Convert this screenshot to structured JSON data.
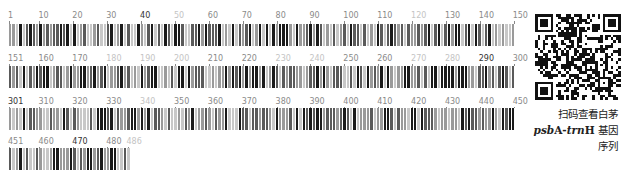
{
  "sequence_barcode": {
    "total_length": 486,
    "bases_per_row": 150,
    "rows": [
      {
        "start": 1,
        "end": 150,
        "ticks": [
          {
            "label": "1",
            "pos": 1,
            "tone": "mid"
          },
          {
            "label": "10",
            "pos": 10,
            "tone": "mid"
          },
          {
            "label": "20",
            "pos": 20,
            "tone": "mid"
          },
          {
            "label": "30",
            "pos": 30,
            "tone": "mid"
          },
          {
            "label": "40",
            "pos": 40,
            "tone": "dark"
          },
          {
            "label": "50",
            "pos": 50,
            "tone": "light"
          },
          {
            "label": "60",
            "pos": 60,
            "tone": "mid"
          },
          {
            "label": "70",
            "pos": 70,
            "tone": "mid"
          },
          {
            "label": "80",
            "pos": 80,
            "tone": "mid"
          },
          {
            "label": "90",
            "pos": 90,
            "tone": "mid"
          },
          {
            "label": "100",
            "pos": 100,
            "tone": "mid"
          },
          {
            "label": "110",
            "pos": 110,
            "tone": "mid"
          },
          {
            "label": "120",
            "pos": 120,
            "tone": "light"
          },
          {
            "label": "130",
            "pos": 130,
            "tone": "mid"
          },
          {
            "label": "140",
            "pos": 140,
            "tone": "mid"
          },
          {
            "label": "150",
            "pos": 150,
            "tone": "mid"
          }
        ]
      },
      {
        "start": 151,
        "end": 300,
        "ticks": [
          {
            "label": "151",
            "pos": 1,
            "tone": "mid"
          },
          {
            "label": "160",
            "pos": 10,
            "tone": "mid"
          },
          {
            "label": "170",
            "pos": 20,
            "tone": "mid"
          },
          {
            "label": "180",
            "pos": 30,
            "tone": "light"
          },
          {
            "label": "190",
            "pos": 40,
            "tone": "light"
          },
          {
            "label": "200",
            "pos": 50,
            "tone": "light"
          },
          {
            "label": "210",
            "pos": 60,
            "tone": "mid"
          },
          {
            "label": "220",
            "pos": 70,
            "tone": "mid"
          },
          {
            "label": "230",
            "pos": 80,
            "tone": "light"
          },
          {
            "label": "240",
            "pos": 90,
            "tone": "light"
          },
          {
            "label": "250",
            "pos": 100,
            "tone": "mid"
          },
          {
            "label": "260",
            "pos": 110,
            "tone": "mid"
          },
          {
            "label": "270",
            "pos": 120,
            "tone": "light"
          },
          {
            "label": "280",
            "pos": 130,
            "tone": "light"
          },
          {
            "label": "290",
            "pos": 140,
            "tone": "dark"
          },
          {
            "label": "300",
            "pos": 150,
            "tone": "mid"
          }
        ]
      },
      {
        "start": 301,
        "end": 450,
        "ticks": [
          {
            "label": "301",
            "pos": 1,
            "tone": "dark"
          },
          {
            "label": "310",
            "pos": 10,
            "tone": "mid"
          },
          {
            "label": "320",
            "pos": 20,
            "tone": "mid"
          },
          {
            "label": "330",
            "pos": 30,
            "tone": "mid"
          },
          {
            "label": "340",
            "pos": 40,
            "tone": "light"
          },
          {
            "label": "350",
            "pos": 50,
            "tone": "mid"
          },
          {
            "label": "360",
            "pos": 60,
            "tone": "mid"
          },
          {
            "label": "370",
            "pos": 70,
            "tone": "mid"
          },
          {
            "label": "380",
            "pos": 80,
            "tone": "mid"
          },
          {
            "label": "390",
            "pos": 90,
            "tone": "mid"
          },
          {
            "label": "400",
            "pos": 100,
            "tone": "mid"
          },
          {
            "label": "410",
            "pos": 110,
            "tone": "mid"
          },
          {
            "label": "420",
            "pos": 120,
            "tone": "mid"
          },
          {
            "label": "430",
            "pos": 130,
            "tone": "mid"
          },
          {
            "label": "440",
            "pos": 140,
            "tone": "mid"
          },
          {
            "label": "450",
            "pos": 150,
            "tone": "mid"
          }
        ]
      },
      {
        "start": 451,
        "end": 486,
        "ticks": [
          {
            "label": "451",
            "pos": 1,
            "tone": "mid"
          },
          {
            "label": "460",
            "pos": 10,
            "tone": "mid"
          },
          {
            "label": "470",
            "pos": 20,
            "tone": "dark"
          },
          {
            "label": "480",
            "pos": 30,
            "tone": "mid"
          },
          {
            "label": "486",
            "pos": 36,
            "tone": "light"
          }
        ]
      }
    ],
    "bar_colors": {
      "A": "#1a1a1a",
      "T": "#5a5a5a",
      "C": "#9a9a9a",
      "G": "#c8c8c8"
    }
  },
  "qr_code": {
    "description": "QR code"
  },
  "caption": {
    "line1": "扫码查看白茅",
    "gene_italic_1": "psb",
    "gene_roman_1": "A-",
    "gene_italic_2": "trn",
    "gene_roman_2": "H",
    "line2_suffix": " 基因",
    "line3": "序列"
  }
}
